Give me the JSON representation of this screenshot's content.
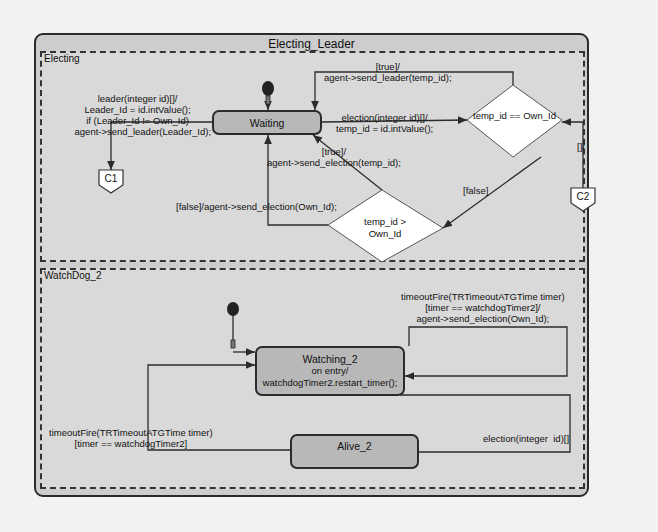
{
  "diagram": {
    "title": "Electing_Leader",
    "colors": {
      "state_fill": "#b8b8b8",
      "container_fill": "#cdcdcd",
      "region_fill": "#d9d9d9",
      "choice_fill": "#ffffff",
      "line": "#2b2b2b"
    },
    "regions": [
      {
        "name": "Electing",
        "states": [
          {
            "name": "Waiting"
          }
        ],
        "choices": [
          {
            "condition": "temp_id ==\nOwn_Id"
          },
          {
            "condition": "temp_id >\nOwn_Id"
          }
        ],
        "connectors": [
          {
            "name": "C1"
          },
          {
            "name": "C2"
          }
        ],
        "transitions": [
          {
            "label": "leader(integer id)[]/\nLeader_Id = id.intValue();\nif (Leader_Id != Own_Id)\n    agent->send_leader(Leader_Id);"
          },
          {
            "label": "[true]/\nagent->send_leader(temp_id);"
          },
          {
            "label": "election(integer id)[]/\ntemp_id = id.intValue();"
          },
          {
            "label": "[true]/\nagent->send_election(temp_id);"
          },
          {
            "label": "[false]/agent->send_election(Own_Id);"
          },
          {
            "label": "[false]"
          },
          {
            "label": "[]/"
          }
        ]
      },
      {
        "name": "WatchDog_2",
        "states": [
          {
            "name": "Watching_2",
            "entry": "on entry/\nwatchdogTimer2.restart_timer();"
          },
          {
            "name": "Alive_2"
          }
        ],
        "transitions": [
          {
            "label": "timeoutFire(TRTimeoutATGTime timer)\n[timer == watchdogTimer2]/\nagent->send_election(Own_Id);"
          },
          {
            "label": "timeoutFire(TRTimeoutATGTime timer)\n[timer == watchdogTimer2]"
          },
          {
            "label": "election(integer  id)[]"
          }
        ]
      }
    ]
  }
}
